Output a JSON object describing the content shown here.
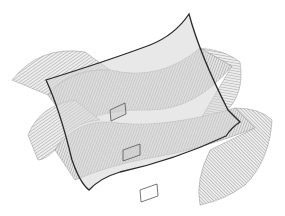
{
  "figure": {
    "colors": {
      "background": "#ffffff",
      "outline": "#2a2a2a",
      "hatch": "#6e6e6e",
      "patch_fill": "#d9d9d9",
      "band_fill": "#e6e6e6"
    },
    "patch_corners": {
      "top_left": [
        46,
        80
      ],
      "top_right": [
        189,
        14
      ],
      "bottom_right": [
        240,
        122
      ],
      "bottom_left": [
        89,
        190
      ]
    },
    "parallelograms": [
      {
        "label": "upper",
        "points": [
          [
            110,
            110
          ],
          [
            125,
            103
          ],
          [
            126,
            114
          ],
          [
            111,
            121
          ]
        ]
      },
      {
        "label": "middle",
        "points": [
          [
            123,
            150
          ],
          [
            140,
            144
          ],
          [
            140,
            155
          ],
          [
            123,
            161
          ]
        ]
      },
      {
        "label": "lower",
        "points": [
          [
            140,
            190
          ],
          [
            157,
            184
          ],
          [
            158,
            196
          ],
          [
            141,
            202
          ]
        ]
      }
    ]
  }
}
